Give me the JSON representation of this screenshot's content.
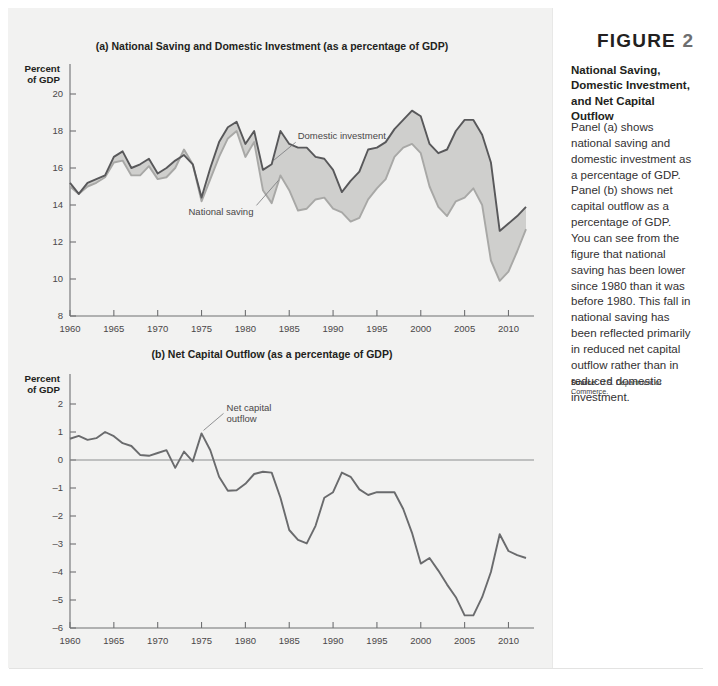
{
  "figure": {
    "label": "FIGURE",
    "number": "2",
    "title": "National Saving, Domestic Investment, and Net Capital Outflow",
    "body": "Panel (a) shows national saving and domestic investment as a percentage of GDP. Panel (b) shows net capital outflow as a percentage of GDP. You can see from the figure that national saving has been lower since 1980 than it was before 1980. This fall in national saving has been reflected primarily in reduced net capital outflow rather than in reduced domestic investment.",
    "source_label": "Source:",
    "source_text": "U.S. Department of Commerce."
  },
  "colors": {
    "page_background": "#f2f2f1",
    "sidebar_background": "#ffffff",
    "investment_line": "#58585a",
    "saving_line": "#a8a8a6",
    "band_fill": "#cfcfcd",
    "nco_line": "#6a6b6d",
    "axis": "#6f7072"
  },
  "chart_data": [
    {
      "type": "line",
      "panel": "a",
      "title": "(a) National Saving and Domestic Investment (as a percentage of GDP)",
      "ylabel_line1": "Percent",
      "ylabel_line2": "of GDP",
      "xlabel": "",
      "xlim": [
        1960,
        2012
      ],
      "ylim": [
        8,
        20
      ],
      "yticks": [
        8,
        10,
        12,
        14,
        16,
        18,
        20
      ],
      "xticks": [
        1960,
        1965,
        1970,
        1975,
        1980,
        1985,
        1990,
        1995,
        2000,
        2005,
        2010
      ],
      "grid": false,
      "legend": "annotations",
      "annotations": [
        {
          "text": "Domestic investment",
          "series": "Domestic investment",
          "year": 1983
        },
        {
          "text": "National saving",
          "series": "National saving",
          "year": 1984
        }
      ],
      "x": [
        1960,
        1961,
        1962,
        1963,
        1964,
        1965,
        1966,
        1967,
        1968,
        1969,
        1970,
        1971,
        1972,
        1973,
        1974,
        1975,
        1976,
        1977,
        1978,
        1979,
        1980,
        1981,
        1982,
        1983,
        1984,
        1985,
        1986,
        1987,
        1988,
        1989,
        1990,
        1991,
        1992,
        1993,
        1994,
        1995,
        1996,
        1997,
        1998,
        1999,
        2000,
        2001,
        2002,
        2003,
        2004,
        2005,
        2006,
        2007,
        2008,
        2009,
        2010,
        2011,
        2012
      ],
      "series": [
        {
          "name": "Domestic investment",
          "values": [
            15.2,
            14.6,
            15.2,
            15.4,
            15.6,
            16.6,
            16.9,
            16.0,
            16.2,
            16.5,
            15.7,
            16.0,
            16.4,
            16.7,
            16.2,
            14.4,
            16.0,
            17.4,
            18.2,
            18.5,
            17.3,
            18.0,
            15.9,
            16.2,
            18.0,
            17.3,
            17.1,
            17.1,
            16.6,
            16.5,
            15.9,
            14.7,
            15.3,
            15.8,
            17.0,
            17.1,
            17.4,
            18.1,
            18.6,
            19.1,
            18.8,
            17.3,
            16.8,
            17.0,
            18.0,
            18.6,
            18.6,
            17.8,
            16.3,
            12.6,
            13.0,
            13.4,
            13.9
          ],
          "unit": "percent of GDP"
        },
        {
          "name": "National saving",
          "values": [
            15.0,
            14.6,
            15.0,
            15.2,
            15.5,
            16.3,
            16.4,
            15.6,
            15.6,
            16.1,
            15.4,
            15.5,
            16.0,
            17.0,
            16.2,
            14.2,
            15.4,
            16.6,
            17.6,
            18.0,
            16.6,
            17.4,
            14.8,
            14.1,
            15.6,
            14.8,
            13.7,
            13.8,
            14.3,
            14.4,
            13.8,
            13.6,
            13.1,
            13.3,
            14.3,
            14.9,
            15.4,
            16.6,
            17.1,
            17.3,
            16.8,
            15.0,
            13.9,
            13.4,
            14.2,
            14.4,
            14.9,
            14.0,
            11.0,
            9.9,
            10.4,
            11.5,
            12.7
          ],
          "unit": "percent of GDP"
        }
      ]
    },
    {
      "type": "line",
      "panel": "b",
      "title": "(b) Net Capital Outflow (as a percentage of GDP)",
      "ylabel_line1": "Percent",
      "ylabel_line2": "of GDP",
      "xlabel": "",
      "xlim": [
        1960,
        2012
      ],
      "ylim": [
        -6,
        2
      ],
      "yticks": [
        -6,
        -5,
        -4,
        -3,
        -2,
        -1,
        0,
        1,
        2
      ],
      "xticks": [
        1960,
        1965,
        1970,
        1975,
        1980,
        1985,
        1990,
        1995,
        2000,
        2005,
        2010
      ],
      "grid": false,
      "zero_line": 0,
      "legend": "annotations",
      "annotations": [
        {
          "text": "Net capital outflow",
          "series": "Net capital outflow",
          "year": 1975
        }
      ],
      "x": [
        1960,
        1961,
        1962,
        1963,
        1964,
        1965,
        1966,
        1967,
        1968,
        1969,
        1970,
        1971,
        1972,
        1973,
        1974,
        1975,
        1976,
        1977,
        1978,
        1979,
        1980,
        1981,
        1982,
        1983,
        1984,
        1985,
        1986,
        1987,
        1988,
        1989,
        1990,
        1991,
        1992,
        1993,
        1994,
        1995,
        1996,
        1997,
        1998,
        1999,
        2000,
        2001,
        2002,
        2003,
        2004,
        2005,
        2006,
        2007,
        2008,
        2009,
        2010,
        2011,
        2012
      ],
      "series": [
        {
          "name": "Net capital outflow",
          "values": [
            0.76,
            0.86,
            0.72,
            0.78,
            1.0,
            0.85,
            0.6,
            0.5,
            0.18,
            0.15,
            0.25,
            0.35,
            -0.28,
            0.3,
            -0.05,
            0.95,
            0.35,
            -0.6,
            -1.1,
            -1.08,
            -0.85,
            -0.5,
            -0.42,
            -0.45,
            -1.35,
            -2.5,
            -2.85,
            -2.98,
            -2.35,
            -1.35,
            -1.15,
            -0.45,
            -0.6,
            -1.05,
            -1.25,
            -1.15,
            -1.15,
            -1.15,
            -1.75,
            -2.6,
            -3.7,
            -3.5,
            -3.95,
            -4.45,
            -4.9,
            -5.55,
            -5.55,
            -4.9,
            -4.0,
            -2.65,
            -3.25,
            -3.4,
            -3.5
          ],
          "unit": "percent of GDP"
        }
      ]
    }
  ]
}
